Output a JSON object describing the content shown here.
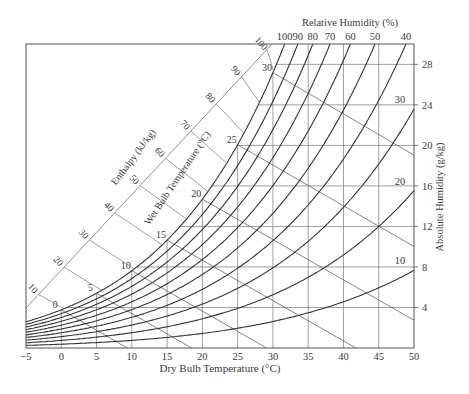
{
  "chart_data": {
    "type": "line",
    "xlabel": "Dry Bulb Temperature (°C)",
    "ylabel": "Absolute Humidity (g/kg)",
    "top_label": "Relative Humidity (%)",
    "enthalpy_label": "Enthalpy (kJ/kg)",
    "wetbulb_label": "Wet Bulb Temperature (°C)",
    "xlim": [
      -5,
      50
    ],
    "ylim": [
      0,
      30
    ],
    "x_ticks": [
      -5,
      0,
      5,
      10,
      15,
      20,
      25,
      30,
      35,
      40,
      45,
      50
    ],
    "y_ticks": [
      4,
      8,
      12,
      16,
      20,
      24,
      28
    ],
    "relative_humidity_series": [
      100,
      90,
      80,
      70,
      60,
      50,
      40,
      30,
      20,
      10
    ],
    "relative_humidity_top_labels": [
      "100",
      "90",
      "80",
      "70",
      "60",
      "50",
      "40"
    ],
    "relative_humidity_right_labels": [
      "30",
      "20",
      "10"
    ],
    "wet_bulb_lines": [
      0,
      5,
      10,
      15,
      20,
      25,
      30
    ],
    "enthalpy_ticks": [
      10,
      20,
      30,
      40,
      50,
      60,
      70,
      80,
      90,
      100
    ],
    "grid": true,
    "legend": "none"
  }
}
